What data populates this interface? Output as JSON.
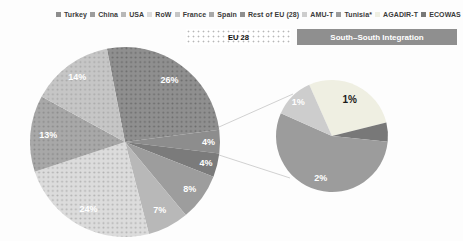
{
  "legend": {
    "items": [
      {
        "label": "Turkey",
        "color": "#8d8d8d"
      },
      {
        "label": "China",
        "color": "#9d9d9d"
      },
      {
        "label": "USA",
        "color": "#b8b8b8"
      },
      {
        "label": "RoW",
        "color": "#dcdcdc"
      },
      {
        "label": "France",
        "color": "#c6c6c6"
      },
      {
        "label": "Spain",
        "color": "#a8a8a8"
      },
      {
        "label": "Rest of EU (28)",
        "color": "#8f8f8f"
      },
      {
        "label": "AMU-T",
        "color": "#cdcdcd"
      },
      {
        "label": "Tunisia*",
        "color": "#9c9c9c"
      },
      {
        "label": "AGADIR-T",
        "color": "#efefe2"
      },
      {
        "label": "ECOWAS",
        "color": "#787878"
      }
    ]
  },
  "group_labels": {
    "eu28": {
      "label": "EU 28",
      "pattern": "dotted"
    },
    "ssi": {
      "label": "South–South Integration",
      "bg": "#8f8f8f",
      "text_color": "#ffffff"
    }
  },
  "chart_data": [
    {
      "type": "pie",
      "name": "main-trade-shares-pie",
      "unit": "%",
      "legend_position": "top",
      "cx": 125,
      "cy": 142,
      "r": 95,
      "start_angle_deg": -11,
      "slices": [
        {
          "value": 26,
          "label": "26%",
          "color": "#8f8f8f",
          "dot_color": "#6c6c6c",
          "label_color": "#ffffff",
          "label_r": 0.8
        },
        {
          "value": 4,
          "label": "4%",
          "color": "#8d8d8d",
          "dot_color": null,
          "label_color": "#ffffff",
          "label_r": 0.88
        },
        {
          "value": 4,
          "label": "4%",
          "color": "#7b7b7b",
          "dot_color": null,
          "label_color": "#ffffff",
          "label_r": 0.88
        },
        {
          "value": 8,
          "label": "8%",
          "color": "#9d9d9d",
          "dot_color": null,
          "label_color": "#ffffff",
          "label_r": 0.84
        },
        {
          "value": 7,
          "label": "7%",
          "color": "#b8b8b8",
          "dot_color": null,
          "label_color": "#ffffff",
          "label_r": 0.8
        },
        {
          "value": 24,
          "label": "24%",
          "color": "#dcdcdc",
          "dot_color": "#b2b2b2",
          "label_color": "#ffffff",
          "label_r": 0.8
        },
        {
          "value": 13,
          "label": "13%",
          "color": "#a8a8a8",
          "dot_color": "#8b8b8b",
          "label_color": "#ffffff",
          "label_r": 0.81
        },
        {
          "value": 14,
          "label": "14%",
          "color": "#c6c6c6",
          "dot_color": "#a9a9a9",
          "label_color": "#ffffff",
          "label_r": 0.85
        }
      ]
    },
    {
      "type": "pie",
      "name": "south-south-detail-pie",
      "unit": "%",
      "cx": 332,
      "cy": 136,
      "r": 56,
      "start_angle_deg": -24,
      "slices": [
        {
          "sweep_deg": 100,
          "label": "1%",
          "color": "#efefe2",
          "dot_color": null,
          "label_color": "#1a1a1a",
          "label_r": 0.72,
          "label_size": 10
        },
        {
          "sweep_deg": 20,
          "label": "",
          "color": "#787878",
          "dot_color": null,
          "label_color": "#ffffff",
          "label_r": 0.8
        },
        {
          "sweep_deg": 198,
          "label": "2%",
          "color": "#9c9c9c",
          "dot_color": null,
          "label_color": "#ffffff",
          "label_r": 0.77
        },
        {
          "sweep_deg": 42,
          "label": "1%",
          "color": "#cdcdcd",
          "dot_color": null,
          "label_color": "#ffffff",
          "label_r": 0.85
        }
      ]
    }
  ],
  "connectors": [
    {
      "x1": 219,
      "y1": 127,
      "x2": 293,
      "y2": 94
    },
    {
      "x1": 219,
      "y1": 155,
      "x2": 290,
      "y2": 178
    }
  ]
}
